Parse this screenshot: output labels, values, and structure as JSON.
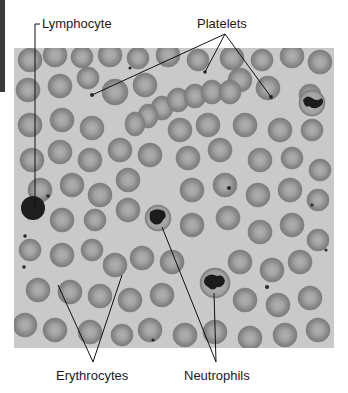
{
  "figure": {
    "labels": {
      "lymphocyte": "Lymphocyte",
      "platelets": "Platelets",
      "erythrocytes": "Erythrocytes",
      "neutrophils": "Neutrophils"
    },
    "colors": {
      "background": "#c9c9c9",
      "rbc_fill": "#8e8e8e",
      "rbc_center": "#a9a9a9",
      "nucleus": "#1c1c1c",
      "leader_line": "#111111"
    }
  }
}
